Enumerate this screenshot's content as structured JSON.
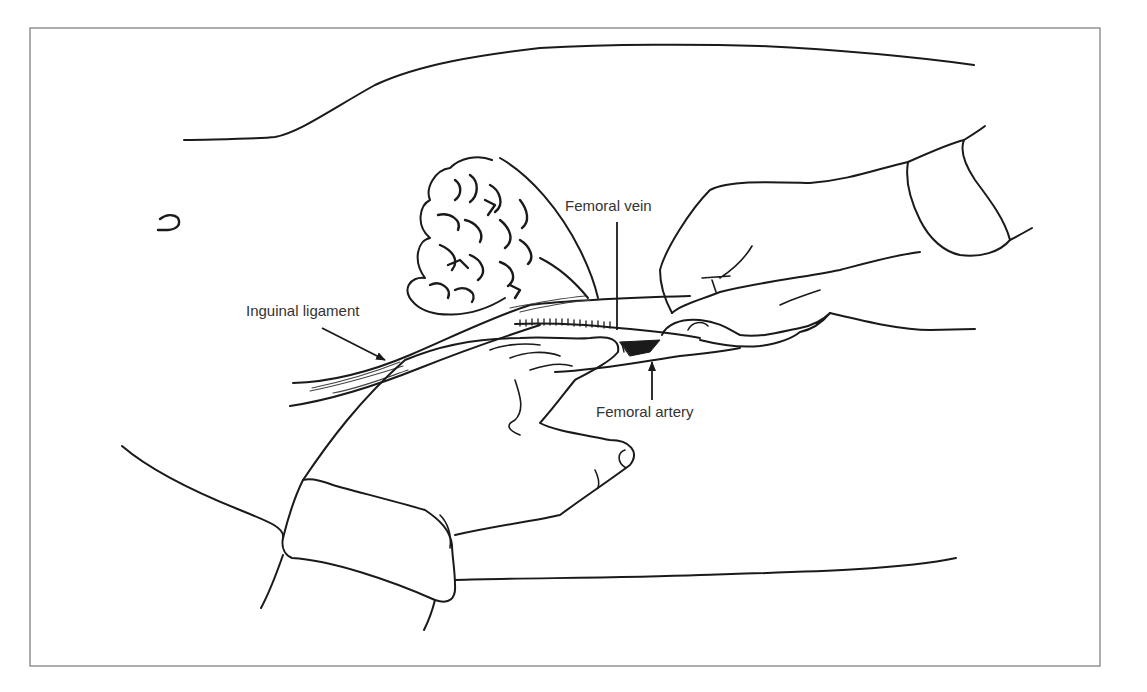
{
  "figure": {
    "type": "surgical-illustration",
    "frame": {
      "x": 30,
      "y": 28,
      "width": 1070,
      "height": 638,
      "border_color": "#777777"
    },
    "line_color": "#1a1a1a",
    "label_color": "#333333"
  },
  "labels": {
    "inguinal_ligament": {
      "text": "Inguinal ligament",
      "x": 246,
      "y": 303
    },
    "femoral_vein": {
      "text": "Femoral vein",
      "x": 565,
      "y": 198
    },
    "femoral_artery": {
      "text": "Femoral artery",
      "x": 596,
      "y": 404
    }
  },
  "annotations": [
    {
      "target": "Inguinal ligament",
      "kind": "arrow",
      "from": [
        322,
        328
      ],
      "to": [
        385,
        360
      ]
    },
    {
      "target": "Femoral vein",
      "kind": "line",
      "from": [
        617,
        222
      ],
      "to": [
        617,
        330
      ]
    },
    {
      "target": "Femoral artery",
      "kind": "arrow",
      "from": [
        652,
        400
      ],
      "to": [
        652,
        360
      ]
    }
  ]
}
